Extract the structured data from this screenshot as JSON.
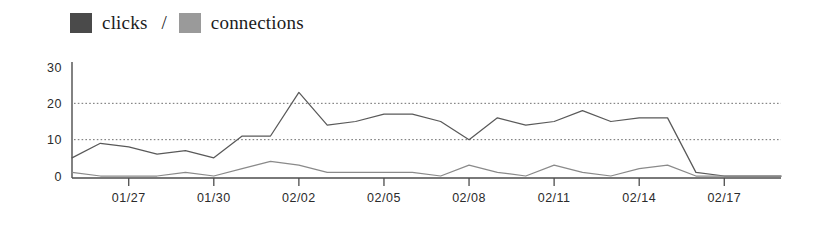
{
  "legend": {
    "items": [
      {
        "label": "clicks",
        "color": "#4a4a4a",
        "swatch_name": "clicks-swatch"
      },
      {
        "label": "connections",
        "color": "#9a9a9a",
        "swatch_name": "connections-swatch"
      }
    ],
    "separator": "/"
  },
  "chart_data": {
    "type": "line",
    "title": "",
    "xlabel": "",
    "ylabel": "",
    "ylim": [
      0,
      30
    ],
    "yticks": [
      0,
      10,
      20,
      30
    ],
    "gridlines": [
      10,
      20
    ],
    "grid": true,
    "legend_position": "top-left",
    "x": [
      "01/25",
      "01/26",
      "01/27",
      "01/28",
      "01/29",
      "01/30",
      "01/31",
      "02/01",
      "02/02",
      "02/03",
      "02/04",
      "02/05",
      "02/06",
      "02/07",
      "02/08",
      "02/09",
      "02/10",
      "02/11",
      "02/12",
      "02/13",
      "02/14",
      "02/15",
      "02/16",
      "02/17",
      "02/18",
      "02/19"
    ],
    "xtick_labels": [
      "01/27",
      "01/30",
      "02/02",
      "02/05",
      "02/08",
      "02/11",
      "02/14",
      "02/17"
    ],
    "xtick_indices": [
      2,
      5,
      8,
      11,
      14,
      17,
      20,
      23
    ],
    "series": [
      {
        "name": "clicks",
        "color": "#595959",
        "values": [
          5,
          9,
          8,
          6,
          7,
          5,
          11,
          11,
          23,
          14,
          15,
          17,
          17,
          15,
          10,
          16,
          14,
          15,
          18,
          15,
          16,
          16,
          1,
          0,
          0,
          0
        ]
      },
      {
        "name": "connections",
        "color": "#8a8a8a",
        "values": [
          1,
          0,
          0,
          0,
          1,
          0,
          2,
          4,
          3,
          1,
          1,
          1,
          1,
          0,
          3,
          1,
          0,
          3,
          1,
          0,
          2,
          3,
          0,
          0,
          0,
          0
        ]
      }
    ]
  },
  "axis": {
    "y_tick_labels": [
      "30",
      "20",
      "10",
      "0"
    ]
  }
}
